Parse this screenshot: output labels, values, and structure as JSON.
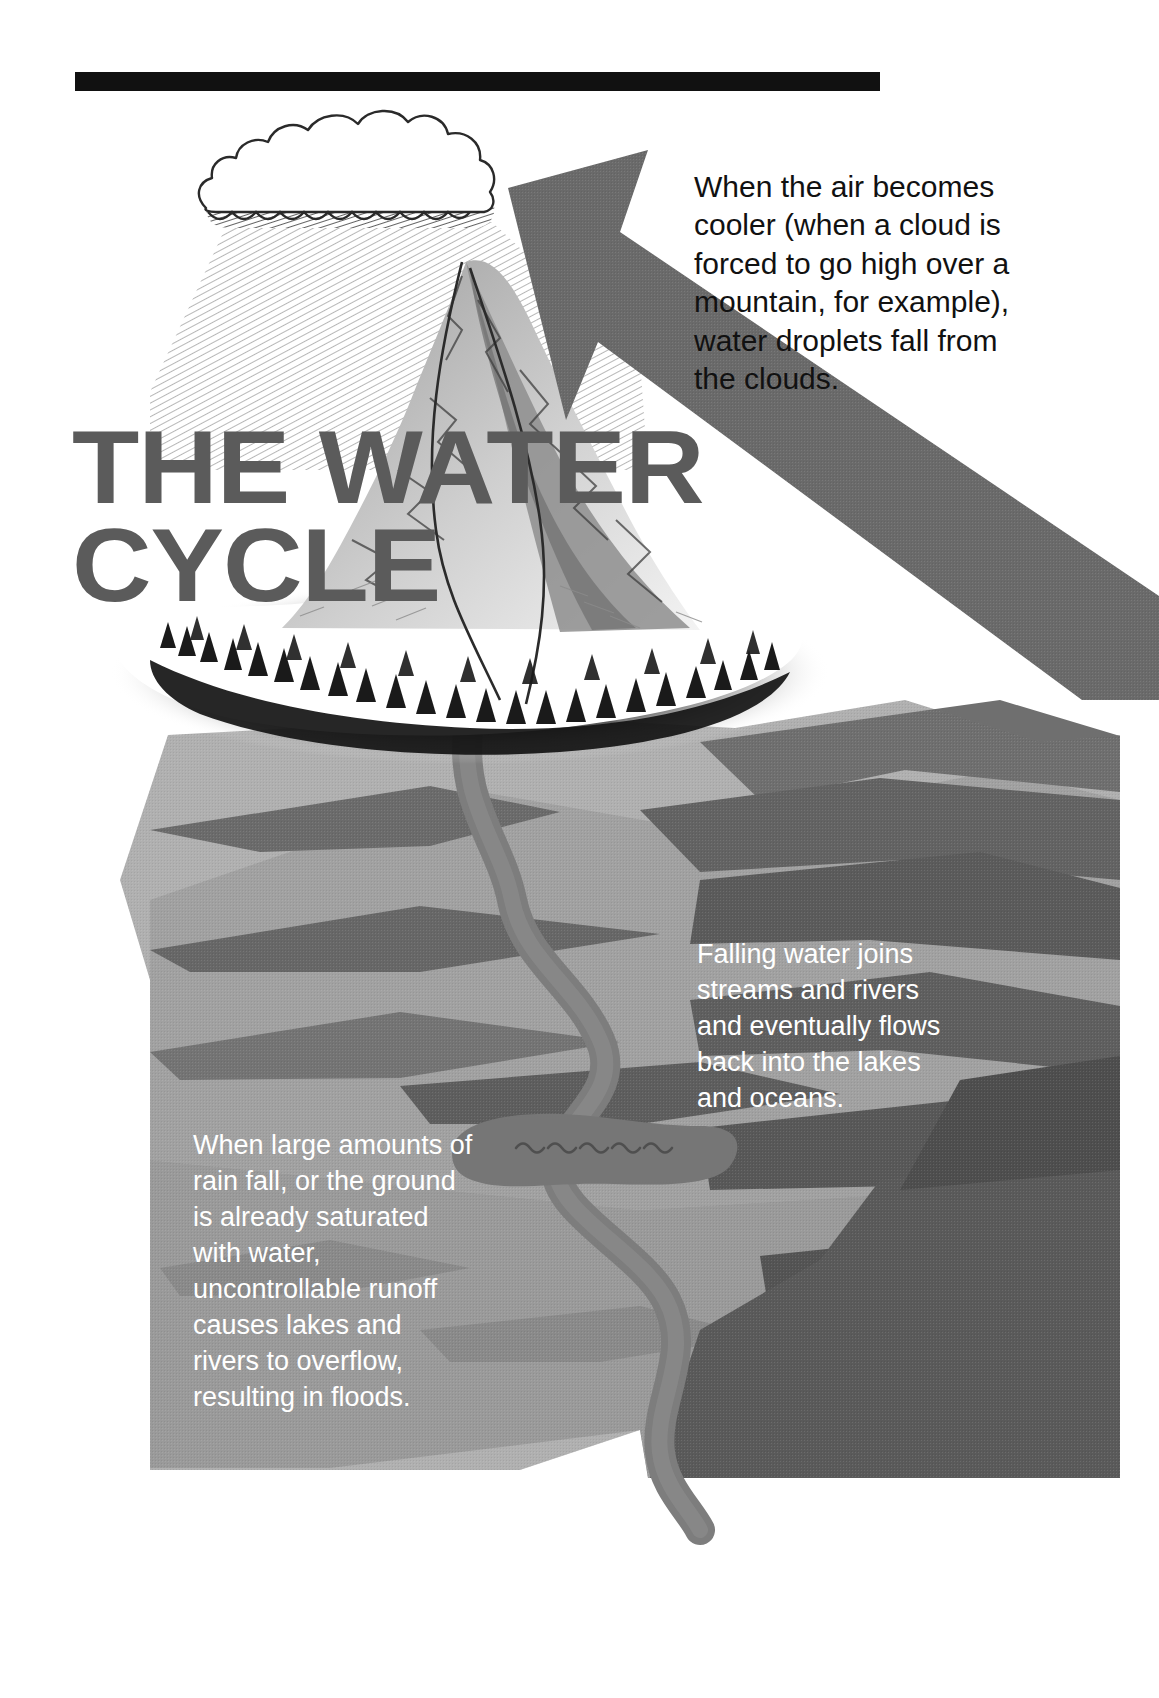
{
  "poster": {
    "title_lines": [
      "THE WATER",
      "CYCLE"
    ],
    "title_color": "#5b5b5b"
  },
  "callouts": {
    "top": {
      "id": "condensation-callout",
      "text": "When the air becomes cooler (when a cloud is forced to go high over a mountain, for example), water droplets fall from the clouds.",
      "color": "#111111"
    },
    "right": {
      "id": "runoff-callout",
      "text": "Falling water joins streams and rivers and eventually flows back into the lakes and oceans.",
      "color": "#ffffff"
    },
    "left": {
      "id": "flood-callout",
      "text": "When large amounts of rain fall, or the ground is already saturated with water, uncontrollable runoff causes lakes and rivers to overflow, resulting in floods.",
      "color": "#ffffff"
    }
  },
  "illustration": {
    "cloud_label": "rain-cloud",
    "rain_label": "rainfall-hatching",
    "mountain_label": "snow-capped-mountain",
    "forest_label": "conifer-forest-belt",
    "arrow_label": "evaporation-arrow",
    "river_label": "river",
    "lake_label": "lake",
    "ground_label": "terrain",
    "rule_label": "top-divider-rule"
  },
  "palette": {
    "ink": "#111111",
    "paper": "#ffffff",
    "title_gray": "#5b5b5b",
    "arrow_gray": "#6a6a6a",
    "ground_light": "#b0b0b0",
    "ground_mid": "#8e8e8e",
    "ground_dark": "#6d6d6d",
    "ground_darker": "#565656",
    "water_gray": "#7c7c7c",
    "shadow": "#1b1b1b"
  }
}
